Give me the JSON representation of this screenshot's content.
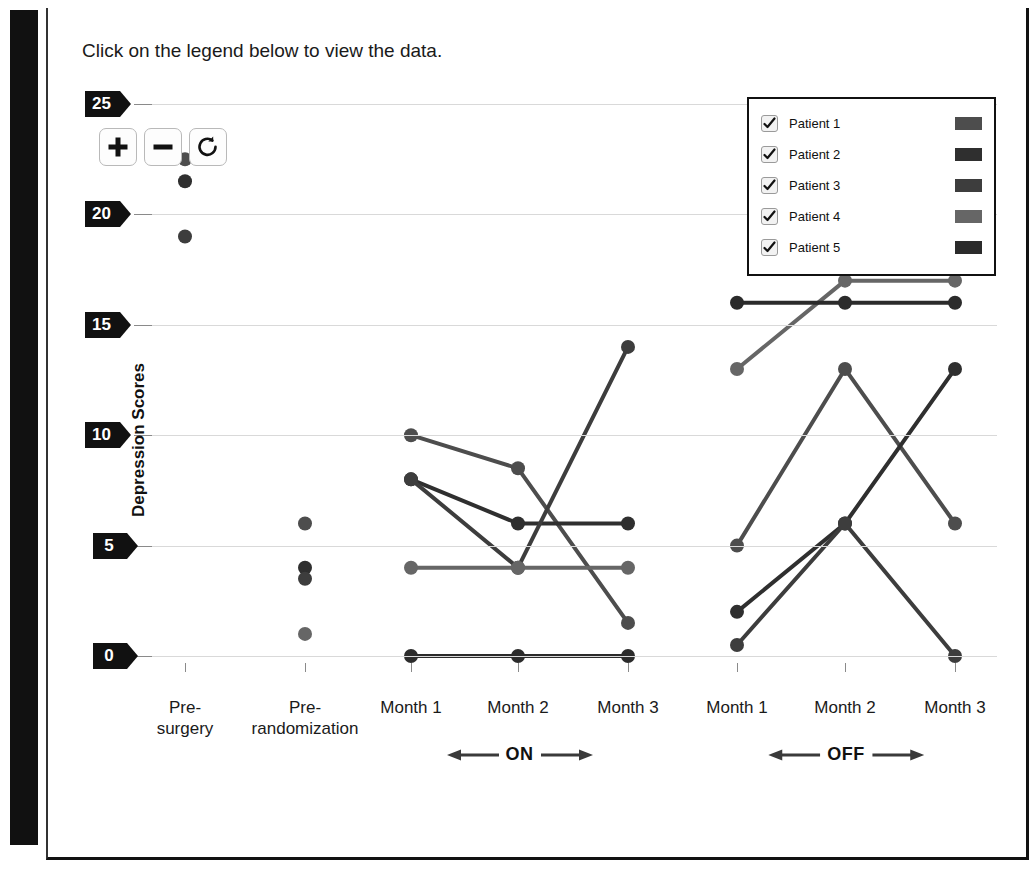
{
  "side_tab": {
    "label": "Interactive"
  },
  "caption": "Click on the legend below to view the data.",
  "controls": {
    "zoom_in": {
      "name": "zoom-in-button",
      "label": "+"
    },
    "zoom_out": {
      "name": "zoom-out-button",
      "label": "−"
    },
    "reset": {
      "name": "reset-button",
      "label": "↺"
    }
  },
  "legend": {
    "items": [
      {
        "label": "Patient 1",
        "color": "#4d4d4d",
        "checked": true
      },
      {
        "label": "Patient 2",
        "color": "#2f2f2f",
        "checked": true
      },
      {
        "label": "Patient 3",
        "color": "#3d3d3d",
        "checked": true
      },
      {
        "label": "Patient 4",
        "color": "#666666",
        "checked": true
      },
      {
        "label": "Patient 5",
        "color": "#2b2b2b",
        "checked": true
      }
    ]
  },
  "chart_data": {
    "type": "line",
    "title": "",
    "xlabel": "",
    "ylabel": "Depression Scores",
    "ylim": [
      0,
      25
    ],
    "yticks": [
      0,
      5,
      10,
      15,
      20,
      25
    ],
    "grid": true,
    "legend_position": "top-right",
    "x": [
      "Pre-surgery",
      "Pre-randomization",
      "Month 1",
      "Month 2",
      "Month 3",
      "Month 1",
      "Month 2",
      "Month 3"
    ],
    "xtick_labels": [
      "Pre-\nsurgery",
      "Pre-\nrandomization",
      "Month 1",
      "Month 2",
      "Month 3",
      "Month 1",
      "Month 2",
      "Month 3"
    ],
    "phase_groups": [
      {
        "label": "ON",
        "from": "Month 1",
        "to": "Month 3"
      },
      {
        "label": "OFF",
        "from": "Month 1",
        "to": "Month 3"
      }
    ],
    "series": [
      {
        "name": "Patient 1",
        "color": "#4d4d4d",
        "values": [
          22.5,
          6,
          10,
          8.5,
          1.5,
          5,
          13,
          6
        ]
      },
      {
        "name": "Patient 2",
        "color": "#2f2f2f",
        "values": [
          21.5,
          4,
          8,
          6,
          6,
          2,
          6,
          13
        ]
      },
      {
        "name": "Patient 3",
        "color": "#3d3d3d",
        "values": [
          19,
          3.5,
          8,
          4,
          14,
          0.5,
          6,
          0
        ]
      },
      {
        "name": "Patient 4",
        "color": "#666666",
        "values": [
          null,
          1,
          4,
          4,
          4,
          13,
          17,
          17
        ]
      },
      {
        "name": "Patient 5",
        "color": "#2b2b2b",
        "values": [
          null,
          null,
          0,
          0,
          0,
          16,
          16,
          16
        ]
      }
    ]
  }
}
